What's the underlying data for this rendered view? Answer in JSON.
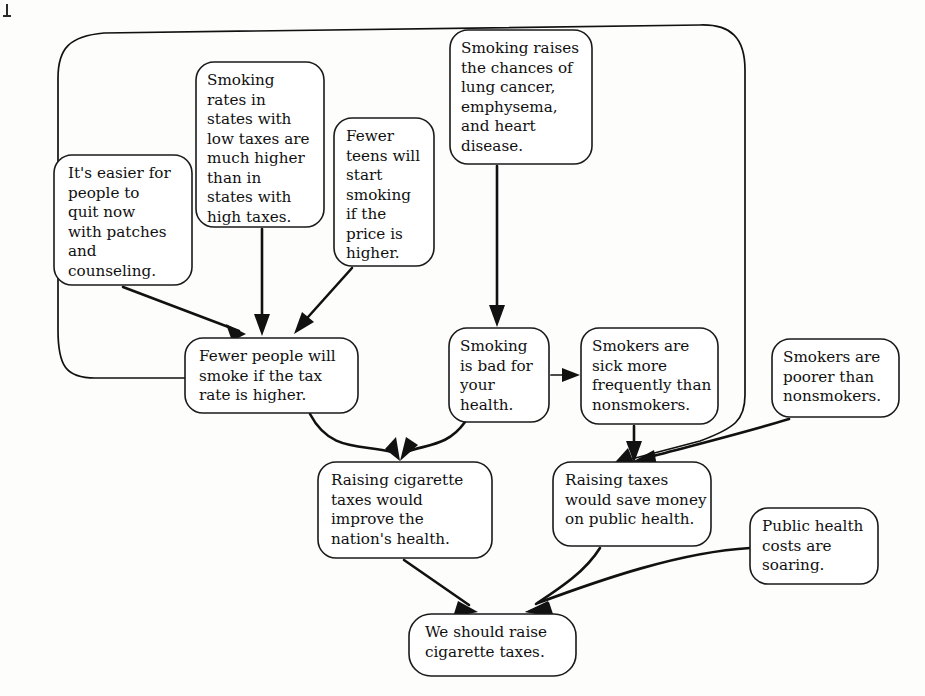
{
  "diagram": {
    "type": "argument-diagram",
    "background_color": "#fdfdfc",
    "line_color": "#111111",
    "box_fill": "#ffffff",
    "box_stroke": "#1a1a1a",
    "nodes": [
      {
        "id": "quit-aids",
        "role": "premise",
        "lines": [
          "It's easier for",
          "people to",
          "quit now",
          "with patches",
          "and",
          "counseling."
        ],
        "x": 54,
        "y": 155,
        "w": 138,
        "h": 130
      },
      {
        "id": "state-rates",
        "role": "premise",
        "lines": [
          "Smoking",
          "rates in",
          "states with",
          "low taxes are",
          "much higher",
          "than in",
          "states with",
          "high taxes."
        ],
        "x": 196,
        "y": 62,
        "w": 128,
        "h": 165
      },
      {
        "id": "fewer-teens",
        "role": "premise",
        "lines": [
          "Fewer",
          "teens will",
          "start",
          "smoking",
          "if the",
          "price is",
          "higher."
        ],
        "x": 334,
        "y": 118,
        "w": 100,
        "h": 148
      },
      {
        "id": "smoking-raises-risk",
        "role": "premise",
        "lines": [
          "Smoking raises",
          "the chances of",
          "lung cancer,",
          "emphysema,",
          "and heart",
          "disease."
        ],
        "x": 450,
        "y": 30,
        "w": 142,
        "h": 134
      },
      {
        "id": "fewer-smoke",
        "role": "intermediate-conclusion",
        "lines": [
          "Fewer people will",
          "smoke if the tax",
          "rate is higher."
        ],
        "x": 185,
        "y": 338,
        "w": 173,
        "h": 75
      },
      {
        "id": "smoking-bad",
        "role": "intermediate-conclusion",
        "lines": [
          "Smoking",
          "is bad for",
          "your",
          "health."
        ],
        "x": 449,
        "y": 328,
        "w": 100,
        "h": 94
      },
      {
        "id": "smokers-sick",
        "role": "premise",
        "lines": [
          "Smokers are",
          "sick more",
          "frequently than",
          "nonsmokers."
        ],
        "x": 581,
        "y": 328,
        "w": 137,
        "h": 96
      },
      {
        "id": "smokers-poorer",
        "role": "premise",
        "lines": [
          "Smokers are",
          "poorer than",
          "nonsmokers."
        ],
        "x": 772,
        "y": 339,
        "w": 127,
        "h": 78
      },
      {
        "id": "improve-health",
        "role": "intermediate-conclusion",
        "lines": [
          "Raising cigarette",
          "taxes would",
          "improve the",
          "nation's health."
        ],
        "x": 318,
        "y": 462,
        "w": 174,
        "h": 96
      },
      {
        "id": "save-money",
        "role": "intermediate-conclusion",
        "lines": [
          "Raising taxes",
          "would save money",
          "on public health."
        ],
        "x": 553,
        "y": 462,
        "w": 158,
        "h": 84
      },
      {
        "id": "costs-soaring",
        "role": "premise",
        "lines": [
          "Public health",
          "costs are",
          "soaring."
        ],
        "x": 750,
        "y": 508,
        "w": 128,
        "h": 76
      },
      {
        "id": "conclusion",
        "role": "final-conclusion",
        "lines": [
          "We should raise",
          "cigarette taxes."
        ],
        "x": 409,
        "y": 614,
        "w": 167,
        "h": 62
      }
    ],
    "edges": [
      {
        "id": "e-quit-to-fewer",
        "from": "quit-aids",
        "to": "fewer-smoke",
        "style": "straight-arrow"
      },
      {
        "id": "e-rates-to-fewer",
        "from": "state-rates",
        "to": "fewer-smoke",
        "style": "straight-arrow"
      },
      {
        "id": "e-teens-to-fewer",
        "from": "fewer-teens",
        "to": "fewer-smoke",
        "style": "straight-arrow"
      },
      {
        "id": "e-risk-to-bad",
        "from": "smoking-raises-risk",
        "to": "smoking-bad",
        "style": "straight-arrow"
      },
      {
        "id": "e-bad-to-sick",
        "from": "smoking-bad",
        "to": "smokers-sick",
        "style": "straight-arrow"
      },
      {
        "id": "e-fewer-to-improve",
        "from": "fewer-smoke",
        "to": "improve-health",
        "style": "curve-arrow"
      },
      {
        "id": "e-bad-to-improve",
        "from": "smoking-bad",
        "to": "improve-health",
        "style": "curve-arrow"
      },
      {
        "id": "e-sick-to-save",
        "from": "smokers-sick",
        "to": "save-money",
        "style": "straight-arrow"
      },
      {
        "id": "e-poorer-to-save",
        "from": "smokers-poorer",
        "to": "save-money",
        "style": "curve-arrow"
      },
      {
        "id": "e-wrap-to-save",
        "from": "fewer-smoke",
        "to": "save-money",
        "style": "long-wrap-curve"
      },
      {
        "id": "e-improve-to-conclusion",
        "from": "improve-health",
        "to": "conclusion",
        "style": "straight-arrow"
      },
      {
        "id": "e-save-to-conclusion",
        "from": "save-money",
        "to": "conclusion",
        "style": "curve-arrow"
      },
      {
        "id": "e-soaring-to-conclusion",
        "from": "costs-soaring",
        "to": "conclusion",
        "style": "curve-arrow"
      }
    ]
  }
}
